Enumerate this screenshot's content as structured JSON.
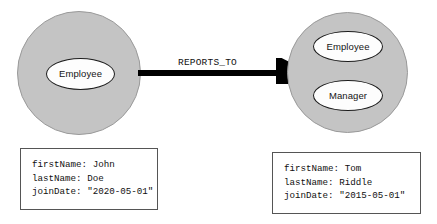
{
  "diagram": {
    "colors": {
      "node_fill": "#c4c4c4",
      "node_stroke": "#9a9a9a",
      "ellipse_fill": "#fdfdfd",
      "ellipse_stroke": "#1c1c1c",
      "arrow": "#000000",
      "box_border": "#555555",
      "text": "#101010",
      "background": "#ffffff"
    },
    "nodes": [
      {
        "id": "node-left",
        "labels": [
          "Employee"
        ],
        "properties": [
          "firstName: John",
          "lastName: Doe",
          "joinDate: \"2020-05-01\""
        ]
      },
      {
        "id": "node-right",
        "labels": [
          "Employee",
          "Manager"
        ],
        "properties": [
          "firstName: Tom",
          "lastName: Riddle",
          "joinDate: \"2015-05-01\""
        ]
      }
    ],
    "relationship": {
      "type": "REPORTS_TO",
      "from": "node-left",
      "to": "node-right",
      "direction": "right"
    }
  }
}
